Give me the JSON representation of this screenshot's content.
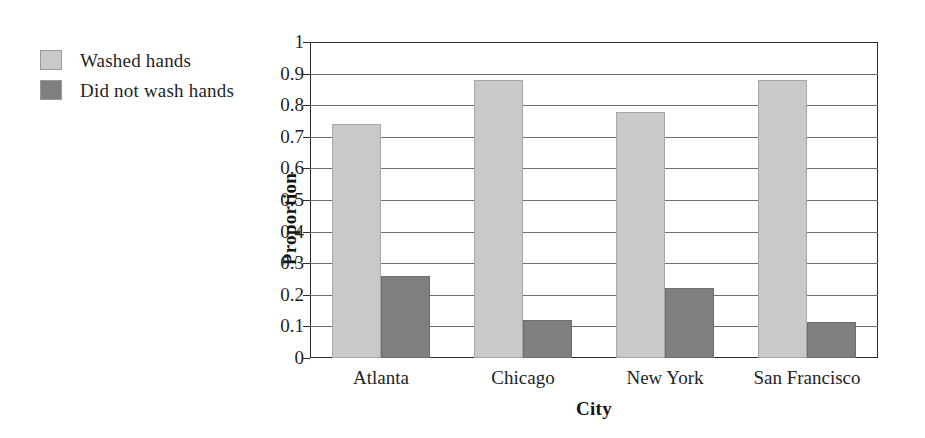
{
  "legend": {
    "items": [
      {
        "label": "Washed hands",
        "color": "#c9c9c9",
        "swatch_name": "legend-swatch-washed"
      },
      {
        "label": "Did not wash hands",
        "color": "#7f7f7f",
        "swatch_name": "legend-swatch-not-washed"
      }
    ]
  },
  "axis": {
    "y_ticks": [
      "1",
      "0.9",
      "0.8",
      "0.7",
      "0.6",
      "0.5",
      "0.4",
      "0.3",
      "0.2",
      "0.1",
      "0"
    ],
    "y_title": "Proportion",
    "x_title": "City"
  },
  "chart_data": {
    "type": "bar",
    "title": "",
    "subtitle": "",
    "xlabel": "City",
    "ylabel": "Proportion",
    "categories": [
      "Atlanta",
      "Chicago",
      "New York",
      "San Francisco"
    ],
    "series": [
      {
        "name": "Washed hands",
        "color": "#c9c9c9",
        "values": [
          0.74,
          0.88,
          0.78,
          0.88
        ]
      },
      {
        "name": "Did not wash hands",
        "color": "#7f7f7f",
        "values": [
          0.26,
          0.12,
          0.22,
          0.115
        ]
      }
    ],
    "ylim": [
      0,
      1
    ],
    "ytick_step": 0.1,
    "ytick_labels": [
      "0",
      "0.1",
      "0.2",
      "0.3",
      "0.4",
      "0.5",
      "0.6",
      "0.7",
      "0.8",
      "0.9",
      "1"
    ],
    "grid": "horizontal",
    "legend_position": "outside-left-top",
    "annotations": []
  }
}
